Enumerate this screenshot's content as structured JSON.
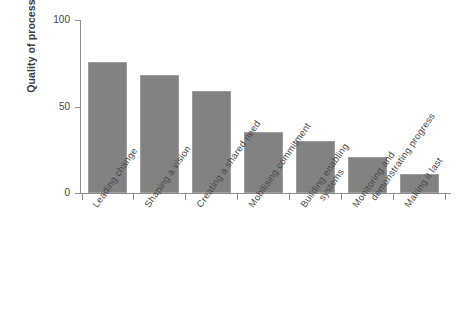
{
  "chart_data": {
    "type": "bar",
    "title": "",
    "subtitle": "",
    "xlabel": "",
    "ylabel": "Quality of process",
    "ylim": [
      0,
      100
    ],
    "yticks": [
      0,
      50,
      100
    ],
    "ytick_labels": [
      "0",
      "50",
      "100"
    ],
    "grid": false,
    "legend": false,
    "legend_position": "none",
    "bar_color": "#828282",
    "axis_color": "#8e8e8e",
    "categories": [
      "Leading change",
      "Shaping a vision",
      "Creating a shared need",
      "Mobilising commitment",
      "Building enabling systems",
      "Monitoring and demonstrating progress",
      "Making it last"
    ],
    "category_lines": [
      [
        "Leading change"
      ],
      [
        "Shaping a vision"
      ],
      [
        "Creating a shared need"
      ],
      [
        "Mobilising commitment"
      ],
      [
        "Building enabling",
        "systems"
      ],
      [
        "Monitoring and",
        "demonstrating progress"
      ],
      [
        "Making it last"
      ]
    ],
    "values": [
      76,
      68,
      59,
      35,
      30,
      21,
      11
    ]
  }
}
